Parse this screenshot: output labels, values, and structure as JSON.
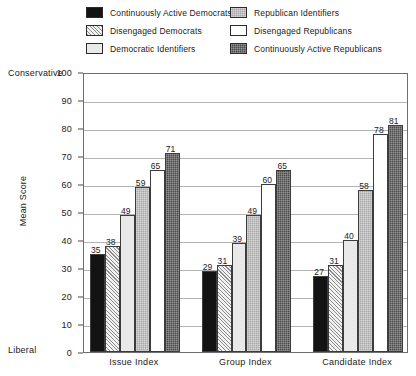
{
  "chart_data": {
    "type": "bar",
    "title": "",
    "xlabel": "",
    "ylabel": "Mean Score",
    "ylim": [
      0,
      100
    ],
    "ytick_step": 10,
    "yticks": [
      0,
      10,
      20,
      30,
      40,
      50,
      60,
      70,
      80,
      90,
      100
    ],
    "grid": true,
    "legend_position": "top",
    "axis_pole_high": "Conservative",
    "axis_pole_low": "Liberal",
    "categories": [
      "Issue Index",
      "Group Index",
      "Candidate Index"
    ],
    "series": [
      {
        "name": "Continuously Active Democrats",
        "values": [
          35,
          29,
          27
        ],
        "fill": "solid-black"
      },
      {
        "name": "Disengaged Democrats",
        "values": [
          38,
          31,
          31
        ],
        "fill": "hatch-light"
      },
      {
        "name": "Democratic Identifiers",
        "values": [
          49,
          39,
          40
        ],
        "fill": "vlight"
      },
      {
        "name": "Republican Identifiers",
        "values": [
          59,
          49,
          58
        ],
        "fill": "midgray"
      },
      {
        "name": "Disengaged Republicans",
        "values": [
          65,
          60,
          78
        ],
        "fill": "white"
      },
      {
        "name": "Continuously Active Republicans",
        "values": [
          71,
          65,
          81
        ],
        "fill": "darkgray"
      }
    ]
  },
  "legend": {
    "columns": [
      [
        {
          "label": "Continuously Active Democrats",
          "fill": "solid-black"
        },
        {
          "label": "Disengaged Democrats",
          "fill": "hatch-light"
        },
        {
          "label": "Democratic Identifiers",
          "fill": "vlight"
        }
      ],
      [
        {
          "label": "Republican Identifiers",
          "fill": "midgray"
        },
        {
          "label": "Disengaged Republicans",
          "fill": "white"
        },
        {
          "label": "Continuously Active Republicans",
          "fill": "darkgray"
        }
      ]
    ]
  },
  "colors": {
    "frame": "#6e6e6e",
    "gridline": "#b4b4b4",
    "text": "#1a1a1a",
    "bar_outline": "#3c3c3c"
  }
}
